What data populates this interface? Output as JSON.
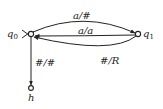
{
  "diagram": {
    "type": "state-transition-diagram",
    "states": [
      {
        "id": "q0",
        "label": "q",
        "subscript": "0",
        "start": true
      },
      {
        "id": "q1",
        "label": "q",
        "subscript": "1"
      },
      {
        "id": "h",
        "label": "h",
        "halting": true
      }
    ],
    "transitions": [
      {
        "from": "q0",
        "to": "q1",
        "label": "a/#"
      },
      {
        "from": "q1",
        "to": "q0",
        "label": "a/a"
      },
      {
        "from": "q1",
        "to": "q0",
        "label": "#/R"
      },
      {
        "from": "q0",
        "to": "h",
        "label": "#/#"
      }
    ]
  }
}
